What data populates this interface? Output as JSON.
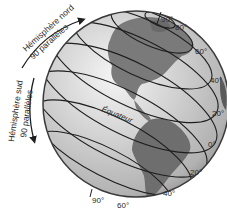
{
  "diagram": {
    "north_label_line1": "Hémisphère nord",
    "north_label_line2": "90 parallèles",
    "south_label_line1": "Hémisphère sud",
    "south_label_line2": "90 parallèles",
    "equator_label": "Équateur",
    "north_latitudes": [
      "90°",
      "80°",
      "60°",
      "40°",
      "20°"
    ],
    "equator_latitude": "0°",
    "south_latitudes": [
      "20°",
      "40°",
      "60°",
      "90°"
    ],
    "colors": {
      "ocean": "#c9c9c9",
      "land": "#7a7a7a",
      "lines": "#1e1e1e",
      "rim": "#3a3a3a"
    }
  }
}
